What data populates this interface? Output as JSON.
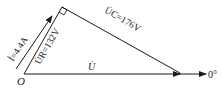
{
  "diagram": {
    "type": "phasor-diagram",
    "origin_label": "O",
    "reference_angle_label": "0°",
    "phasors": {
      "current": {
        "symbol": "İ",
        "label": "İ=4.4A",
        "value": "4.4A"
      },
      "resistor_voltage": {
        "symbol": "U̇R",
        "label": "U̇R=132V",
        "value": "132V"
      },
      "capacitor_voltage": {
        "symbol": "U̇C",
        "label": "U̇C=176V",
        "value": "176V"
      },
      "total_voltage": {
        "symbol": "U̇",
        "label": "U̇"
      }
    },
    "colors": {
      "line": "#1a1a1a",
      "background": "#ffffff"
    }
  }
}
